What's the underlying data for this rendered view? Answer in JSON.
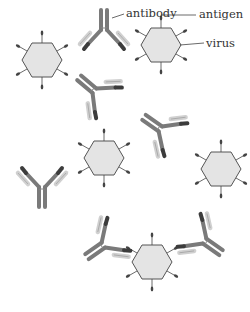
{
  "labels": {
    "antibody": "antibody",
    "antigen": "antigen",
    "virus": "virus"
  },
  "colors": {
    "virus_fill": "#e4e4e4",
    "virus_stroke": "#555555",
    "heavy_chain": "#7a7a7a",
    "heavy_chain_dark": "#3c3c3c",
    "light_chain": "#d0d0d0",
    "antigen": "#444444",
    "leader_line": "#444444"
  },
  "viruses": [
    {
      "id": "virus-1",
      "cx": 42,
      "cy": 60
    },
    {
      "id": "virus-2",
      "cx": 161,
      "cy": 45
    },
    {
      "id": "virus-3",
      "cx": 104,
      "cy": 158
    },
    {
      "id": "virus-4",
      "cx": 221,
      "cy": 169
    },
    {
      "id": "virus-5",
      "cx": 152,
      "cy": 262
    }
  ],
  "antibodies": [
    {
      "id": "antibody-1",
      "x": 104,
      "y": 32,
      "rot": 180
    },
    {
      "id": "antibody-2",
      "x": 96,
      "y": 92,
      "rot": 130
    },
    {
      "id": "antibody-3",
      "x": 42,
      "y": 185,
      "rot": 0
    },
    {
      "id": "antibody-4",
      "x": 162,
      "y": 130,
      "rot": 125
    },
    {
      "id": "antibody-5",
      "x": 105,
      "y": 244,
      "rot": 55
    },
    {
      "id": "antibody-6",
      "x": 203,
      "y": 240,
      "rot": -55
    }
  ]
}
